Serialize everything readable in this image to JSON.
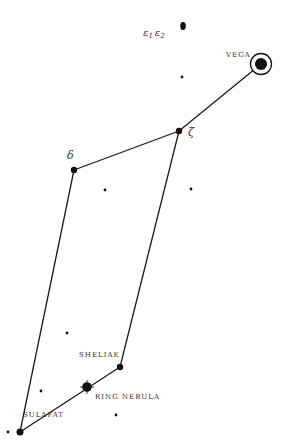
{
  "diagram": {
    "colors": {
      "line": "#1a1a1a",
      "star": "#111111",
      "label": "#333333",
      "background": "#ffffff"
    },
    "stars": [
      {
        "id": "vega",
        "label": "VEGA",
        "x": 261,
        "y": 64,
        "r": 6,
        "ring": 11
      },
      {
        "id": "zeta",
        "label": "ζ",
        "x": 179,
        "y": 131,
        "r": 3.2
      },
      {
        "id": "delta",
        "label": "δ",
        "x": 74,
        "y": 170,
        "r": 3.2
      },
      {
        "id": "sheliak",
        "label": "SHELIAK",
        "x": 120,
        "y": 367,
        "r": 3.2
      },
      {
        "id": "sulafat",
        "label": "SULAFAT",
        "x": 20,
        "y": 432,
        "r": 3.5
      },
      {
        "id": "ring-nebula",
        "label": "RING NEBULA",
        "x": 87,
        "y": 387,
        "r": 4.5
      },
      {
        "id": "epsilon",
        "label": "ε1 ε2",
        "x": 183,
        "y": 26,
        "r": 3
      }
    ],
    "epsilon_label": {
      "e1": "ε",
      "s1": "1",
      "e2": "ε",
      "s2": "2"
    },
    "faint_stars": [
      {
        "x": 182,
        "y": 77
      },
      {
        "x": 105,
        "y": 190
      },
      {
        "x": 191,
        "y": 189
      },
      {
        "x": 67,
        "y": 333
      },
      {
        "x": 41,
        "y": 391
      },
      {
        "x": 116,
        "y": 415
      },
      {
        "x": 8,
        "y": 432
      }
    ],
    "lines": [
      [
        "vega",
        "zeta"
      ],
      [
        "zeta",
        "delta"
      ],
      [
        "delta",
        "sulafat"
      ],
      [
        "zeta",
        "sheliak"
      ],
      [
        "sheliak",
        "sulafat"
      ]
    ]
  }
}
